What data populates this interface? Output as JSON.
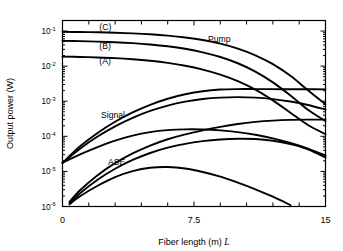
{
  "chart_data": {
    "type": "line",
    "title": "",
    "xlabel": "Fiber length (m) L",
    "ylabel": "Output power (W)",
    "xlim": [
      0,
      15
    ],
    "ylim": [
      1e-06,
      0.2
    ],
    "yscale": "log",
    "xscale": "linear",
    "grid": false,
    "legend": "none",
    "xticks": [
      0,
      7.5,
      15
    ],
    "xticklabels": [
      "0",
      "7.5",
      "15"
    ],
    "x_minor_tick_step": 1.5,
    "yticks": [
      0.1,
      0.01,
      0.001,
      0.0001,
      1e-05,
      1e-06
    ],
    "yticklabels": [
      "10-1",
      "10-2",
      "10-3",
      "10-4",
      "10-5",
      "10-6"
    ],
    "ytick_mantissa": "10",
    "ytick_exponents": [
      "-1",
      "-2",
      "-3",
      "-4",
      "-5",
      "-6"
    ],
    "annotations": [
      {
        "text": "(C)",
        "x": 2.1,
        "y": 0.105,
        "name": "curve-label-c"
      },
      {
        "text": "(B)",
        "x": 2.1,
        "y": 0.031,
        "name": "curve-label-b"
      },
      {
        "text": "(A)",
        "x": 2.1,
        "y": 0.0115,
        "name": "curve-label-a"
      },
      {
        "text": "Pump",
        "x": 8.3,
        "y": 0.048,
        "name": "curve-label-pump"
      },
      {
        "text": "Signal",
        "x": 2.2,
        "y": 0.00034,
        "name": "curve-label-signal"
      },
      {
        "text": "ASE",
        "x": 2.6,
        "y": 1.55e-05,
        "name": "curve-label-ase"
      }
    ],
    "series": [
      {
        "name": "Pump C",
        "group": "Pump",
        "case": "C",
        "x": [
          0,
          1,
          2,
          3,
          4,
          5,
          6,
          7,
          8,
          9,
          10,
          11,
          12,
          13,
          14,
          15
        ],
        "y": [
          0.095,
          0.0938,
          0.0921,
          0.0895,
          0.0858,
          0.0808,
          0.0742,
          0.0657,
          0.0554,
          0.0437,
          0.0316,
          0.0204,
          0.0114,
          0.0053,
          0.00206,
          0.00082
        ]
      },
      {
        "name": "Pump B",
        "group": "Pump",
        "case": "B",
        "x": [
          0,
          1,
          2,
          3,
          4,
          5,
          6,
          7,
          8,
          9,
          10,
          11,
          12,
          13,
          14,
          15
        ],
        "y": [
          0.0525,
          0.0515,
          0.0501,
          0.0481,
          0.0453,
          0.0416,
          0.0369,
          0.0312,
          0.0248,
          0.0182,
          0.0121,
          0.007,
          0.00345,
          0.00146,
          0.00057,
          0.00027
        ]
      },
      {
        "name": "Pump A",
        "group": "Pump",
        "case": "A",
        "x": [
          0,
          1,
          2,
          3,
          4,
          5,
          6,
          7,
          8,
          9,
          10,
          11,
          12,
          13,
          14,
          15
        ],
        "y": [
          0.0187,
          0.0183,
          0.0177,
          0.0169,
          0.0157,
          0.0142,
          0.0124,
          0.0103,
          0.008,
          0.00575,
          0.00375,
          0.00215,
          0.00106,
          0.00047,
          0.00021,
          0.000115
        ]
      },
      {
        "name": "Signal C",
        "group": "Signal",
        "case": "C",
        "x": [
          0,
          1,
          2,
          3,
          4,
          5,
          6,
          7,
          8,
          9,
          10,
          11,
          12,
          13,
          14,
          15
        ],
        "y": [
          1.75e-05,
          5.2e-05,
          0.000125,
          0.00026,
          0.00048,
          0.00079,
          0.00118,
          0.00158,
          0.00193,
          0.00215,
          0.00222,
          0.00222,
          0.00221,
          0.0022,
          0.00219,
          0.00218
        ]
      },
      {
        "name": "Signal B",
        "group": "Signal",
        "case": "B",
        "x": [
          0,
          1,
          2,
          3,
          4,
          5,
          6,
          7,
          8,
          9,
          10,
          11,
          12,
          13,
          14,
          15
        ],
        "y": [
          1.75e-05,
          4.45e-05,
          9.85e-05,
          0.000192,
          0.000336,
          0.000528,
          0.000752,
          0.000975,
          0.00116,
          0.00127,
          0.00131,
          0.00127,
          0.00115,
          0.00098,
          0.00078,
          0.00058
        ]
      },
      {
        "name": "Signal A",
        "group": "Signal",
        "case": "A",
        "x": [
          0,
          1,
          2,
          3,
          4,
          5,
          6,
          7,
          8,
          9,
          10,
          11,
          12,
          13,
          14,
          15
        ],
        "y": [
          1.75e-05,
          3.05e-05,
          4.95e-05,
          7.55e-05,
          0.000105,
          0.000132,
          0.00015,
          0.000158,
          0.000157,
          0.000148,
          0.000132,
          0.000111,
          8.75e-05,
          6.45e-05,
          4.45e-05,
          2.85e-05
        ]
      },
      {
        "name": "ASE C",
        "group": "ASE",
        "case": "C",
        "x": [
          0.4,
          1,
          2,
          3,
          4,
          5,
          6,
          7,
          8,
          9,
          10,
          11,
          12,
          13,
          14,
          15
        ],
        "y": [
          1.35e-06,
          2.9e-06,
          7.8e-06,
          1.72e-05,
          3.25e-05,
          5.45e-05,
          8.25e-05,
          0.000114,
          0.000148,
          0.000186,
          0.000225,
          0.000258,
          0.000281,
          0.000294,
          0.000299,
          0.0003
        ]
      },
      {
        "name": "ASE B",
        "group": "ASE",
        "case": "B",
        "x": [
          0.4,
          1,
          2,
          3,
          4,
          5,
          6,
          7,
          8,
          9,
          10,
          11,
          12,
          13,
          14,
          15
        ],
        "y": [
          1.25e-06,
          2.4e-06,
          5.8e-06,
          1.19e-05,
          2.12e-05,
          3.35e-05,
          4.75e-05,
          6.12e-05,
          7.27e-05,
          8.11e-05,
          8.53e-05,
          8.38e-05,
          7.45e-05,
          5.97e-05,
          4.25e-05,
          2.48e-05
        ]
      },
      {
        "name": "ASE A",
        "group": "ASE",
        "case": "A",
        "x": [
          0.4,
          1,
          2,
          3,
          4,
          5,
          6,
          7,
          8,
          9,
          10,
          11,
          12,
          13
        ],
        "y": [
          1.15e-06,
          1.95e-06,
          3.9e-06,
          6.9e-06,
          1.02e-05,
          1.27e-05,
          1.33e-05,
          1.21e-05,
          9.6e-06,
          7.1e-06,
          4.8e-06,
          3.1e-06,
          1.9e-06,
          1.1e-06
        ]
      }
    ]
  }
}
